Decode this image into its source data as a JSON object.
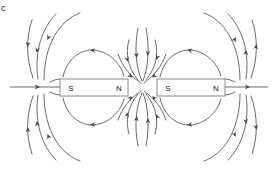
{
  "figure": {
    "panel_label": "c",
    "background_color": "#ffffff",
    "line_color": "#6b6b6b",
    "arrow_color": "#4a4a4a",
    "magnet_outline_color": "#8a8a8a",
    "label_color": "#1a1a1a",
    "width": 275,
    "height": 177
  },
  "magnets": [
    {
      "id": "left-magnet",
      "x": 60,
      "y": 79,
      "width": 68,
      "height": 17,
      "left_pole": "S",
      "right_pole": "N",
      "left_pole_x": 71,
      "right_pole_x": 119,
      "label_y": 88
    },
    {
      "id": "right-magnet",
      "x": 157,
      "y": 79,
      "width": 68,
      "height": 17,
      "left_pole": "S",
      "right_pole": "N",
      "left_pole_x": 168,
      "right_pole_x": 216,
      "label_y": 88
    }
  ],
  "axis_lines": [
    {
      "id": "left-axis",
      "x1": 10,
      "y1": 87,
      "x2": 60,
      "y2": 87,
      "arrow_x": 37,
      "arrow_dir": "right"
    },
    {
      "id": "right-axis",
      "x1": 225,
      "y1": 87,
      "x2": 268,
      "y2": 87,
      "arrow_x": 248,
      "arrow_dir": "right"
    }
  ],
  "field_lines": {
    "count": 26,
    "description": "Magnetic field lines around two collinear bar magnets with facing N and S poles",
    "center_gap_x": 142
  }
}
